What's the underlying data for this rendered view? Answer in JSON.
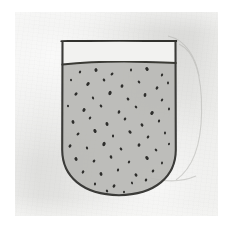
{
  "scene": {
    "title": "Hand-drawn vessel filled with particles",
    "medium": "pencil sketch on paper",
    "canvas": {
      "width": 237,
      "height": 237,
      "background": "#ffffff"
    }
  },
  "paper": {
    "label": "paper-sheet",
    "x": 15,
    "y": 12,
    "width": 203,
    "height": 204,
    "color": "#e9e9e7",
    "edge_color": "#ffffff"
  },
  "vessel": {
    "label": "beaker",
    "shape": "u-shaped-container",
    "stroke_color": "#3a3a38",
    "stroke_width": 2.1,
    "left_wall_x": 62,
    "right_wall_x": 176,
    "rim_y": 41,
    "bottom_y": 195,
    "corner_radius": 56,
    "outline_path": "M 62.5 42.0 L 62.2 150.0 C 62.4 176.0 82.0 194.6 119.0 195.2 C 156.0 194.6 175.6 176.0 175.8 150.0 L 175.5 41.6"
  },
  "rim": {
    "label": "vessel-rim-line",
    "path": "M 61.6 41.4 C 90.0 40.3 140.0 40.4 176.0 41.0",
    "stroke_color": "#33332f",
    "stroke_width": 2.4
  },
  "fill_line": {
    "label": "liquid-surface-line",
    "y": 63,
    "path": "M 62.4 64.6 C 86.0 62.0 118.0 61.2 146.0 61.9 C 160.0 62.2 170.0 62.6 175.8 63.0",
    "stroke_color": "#3a3a36",
    "stroke_width": 2.0
  },
  "fill_region": {
    "label": "granular-contents",
    "color": "#b9b9b5",
    "opacity": 0.92,
    "path": "M 62.4 64.4 C 86.0 61.9 118.0 61.1 146.0 61.8 C 160.0 62.1 170.0 62.5 175.7 62.9 L 175.8 150.0 C 175.6 176.0 156.0 194.2 119.0 194.8 C 82.0 194.2 62.4 176.0 62.2 150.0 Z"
  },
  "headspace": {
    "label": "empty-headspace",
    "color": "#f2f2f0",
    "top_y": 41,
    "bottom_y": 63
  },
  "ghost_outline": {
    "label": "erased-construction-line",
    "stroke_color": "#b4b4b0",
    "stroke_width": 1.1,
    "opacity": 0.55,
    "paths": [
      "M 179.0 44.0 C 196.0 52.0 202.0 78.0 201.6 112.0 C 201.2 146.0 193.0 168.0 176.0 180.0",
      "M 168.0 36.0 C 186.0 40.0 196.0 58.0 199.0 76.0",
      "M 150.0 178.0 C 166.0 182.0 182.0 182.0 196.0 176.0"
    ]
  },
  "particles": {
    "label": "suspended-particles",
    "count": 62,
    "color": "#2e2e2c",
    "typical_size_px": [
      2,
      3
    ],
    "points": [
      {
        "x": 80,
        "y": 72,
        "rx": 1.1,
        "ry": 1.5,
        "rot": 25
      },
      {
        "x": 96,
        "y": 70,
        "rx": 1.5,
        "ry": 1.9,
        "rot": -15
      },
      {
        "x": 112,
        "y": 74,
        "rx": 1.2,
        "ry": 1.7,
        "rot": 40
      },
      {
        "x": 131,
        "y": 70,
        "rx": 1.0,
        "ry": 1.4,
        "rot": 10
      },
      {
        "x": 147,
        "y": 69,
        "rx": 1.6,
        "ry": 2.0,
        "rot": -30
      },
      {
        "x": 162,
        "y": 75,
        "rx": 1.1,
        "ry": 1.5,
        "rot": 18
      },
      {
        "x": 71,
        "y": 80,
        "rx": 1.0,
        "ry": 1.3,
        "rot": -5
      },
      {
        "x": 88,
        "y": 84,
        "rx": 1.5,
        "ry": 2.1,
        "rot": 35
      },
      {
        "x": 104,
        "y": 80,
        "rx": 1.2,
        "ry": 1.6,
        "rot": -22
      },
      {
        "x": 122,
        "y": 86,
        "rx": 1.4,
        "ry": 1.8,
        "rot": 12
      },
      {
        "x": 139,
        "y": 82,
        "rx": 1.1,
        "ry": 1.5,
        "rot": -40
      },
      {
        "x": 157,
        "y": 88,
        "rx": 1.3,
        "ry": 1.7,
        "rot": 28
      },
      {
        "x": 168,
        "y": 83,
        "rx": 1.0,
        "ry": 1.4,
        "rot": 0
      },
      {
        "x": 76,
        "y": 94,
        "rx": 1.3,
        "ry": 1.8,
        "rot": 45
      },
      {
        "x": 93,
        "y": 98,
        "rx": 1.1,
        "ry": 1.5,
        "rot": -18
      },
      {
        "x": 110,
        "y": 93,
        "rx": 1.6,
        "ry": 2.2,
        "rot": 20
      },
      {
        "x": 128,
        "y": 99,
        "rx": 1.2,
        "ry": 1.6,
        "rot": -35
      },
      {
        "x": 145,
        "y": 95,
        "rx": 1.4,
        "ry": 1.9,
        "rot": 8
      },
      {
        "x": 162,
        "y": 100,
        "rx": 1.1,
        "ry": 1.5,
        "rot": 33
      },
      {
        "x": 68,
        "y": 106,
        "rx": 1.0,
        "ry": 1.3,
        "rot": -10
      },
      {
        "x": 84,
        "y": 110,
        "rx": 1.5,
        "ry": 2.0,
        "rot": 24
      },
      {
        "x": 101,
        "y": 106,
        "rx": 1.2,
        "ry": 1.6,
        "rot": -28
      },
      {
        "x": 119,
        "y": 112,
        "rx": 1.3,
        "ry": 1.8,
        "rot": 15
      },
      {
        "x": 136,
        "y": 107,
        "rx": 1.1,
        "ry": 1.5,
        "rot": -42
      },
      {
        "x": 152,
        "y": 113,
        "rx": 1.6,
        "ry": 2.1,
        "rot": 30
      },
      {
        "x": 169,
        "y": 109,
        "rx": 1.0,
        "ry": 1.4,
        "rot": 5
      },
      {
        "x": 73,
        "y": 122,
        "rx": 1.4,
        "ry": 1.9,
        "rot": -20
      },
      {
        "x": 90,
        "y": 118,
        "rx": 1.1,
        "ry": 1.5,
        "rot": 38
      },
      {
        "x": 107,
        "y": 124,
        "rx": 1.5,
        "ry": 2.0,
        "rot": -12
      },
      {
        "x": 125,
        "y": 119,
        "rx": 1.2,
        "ry": 1.6,
        "rot": 22
      },
      {
        "x": 142,
        "y": 125,
        "rx": 1.3,
        "ry": 1.7,
        "rot": -33
      },
      {
        "x": 159,
        "y": 121,
        "rx": 1.1,
        "ry": 1.5,
        "rot": 14
      },
      {
        "x": 78,
        "y": 134,
        "rx": 1.2,
        "ry": 1.7,
        "rot": 42
      },
      {
        "x": 95,
        "y": 131,
        "rx": 1.5,
        "ry": 2.1,
        "rot": -25
      },
      {
        "x": 113,
        "y": 136,
        "rx": 1.1,
        "ry": 1.4,
        "rot": 9
      },
      {
        "x": 130,
        "y": 132,
        "rx": 1.4,
        "ry": 1.9,
        "rot": -38
      },
      {
        "x": 148,
        "y": 137,
        "rx": 1.2,
        "ry": 1.6,
        "rot": 26
      },
      {
        "x": 165,
        "y": 133,
        "rx": 1.0,
        "ry": 1.4,
        "rot": -8
      },
      {
        "x": 70,
        "y": 146,
        "rx": 1.3,
        "ry": 1.8,
        "rot": 32
      },
      {
        "x": 87,
        "y": 148,
        "rx": 1.1,
        "ry": 1.5,
        "rot": -16
      },
      {
        "x": 104,
        "y": 144,
        "rx": 1.6,
        "ry": 2.2,
        "rot": 20
      },
      {
        "x": 121,
        "y": 149,
        "rx": 1.2,
        "ry": 1.6,
        "rot": -30
      },
      {
        "x": 139,
        "y": 145,
        "rx": 1.4,
        "ry": 1.8,
        "rot": 11
      },
      {
        "x": 156,
        "y": 150,
        "rx": 1.1,
        "ry": 1.5,
        "rot": -44
      },
      {
        "x": 169,
        "y": 144,
        "rx": 1.0,
        "ry": 1.3,
        "rot": 17
      },
      {
        "x": 76,
        "y": 159,
        "rx": 1.5,
        "ry": 2.0,
        "rot": -22
      },
      {
        "x": 94,
        "y": 161,
        "rx": 1.2,
        "ry": 1.6,
        "rot": 36
      },
      {
        "x": 111,
        "y": 157,
        "rx": 1.3,
        "ry": 1.8,
        "rot": -14
      },
      {
        "x": 129,
        "y": 162,
        "rx": 1.1,
        "ry": 1.5,
        "rot": 27
      },
      {
        "x": 147,
        "y": 158,
        "rx": 1.5,
        "ry": 2.1,
        "rot": -36
      },
      {
        "x": 162,
        "y": 163,
        "rx": 1.0,
        "ry": 1.4,
        "rot": 6
      },
      {
        "x": 83,
        "y": 172,
        "rx": 1.2,
        "ry": 1.7,
        "rot": 29
      },
      {
        "x": 101,
        "y": 174,
        "rx": 1.4,
        "ry": 1.9,
        "rot": -19
      },
      {
        "x": 118,
        "y": 170,
        "rx": 1.1,
        "ry": 1.5,
        "rot": 13
      },
      {
        "x": 136,
        "y": 175,
        "rx": 1.3,
        "ry": 1.8,
        "rot": -31
      },
      {
        "x": 153,
        "y": 171,
        "rx": 1.2,
        "ry": 1.6,
        "rot": 23
      },
      {
        "x": 95,
        "y": 184,
        "rx": 1.1,
        "ry": 1.4,
        "rot": -7
      },
      {
        "x": 114,
        "y": 186,
        "rx": 1.3,
        "ry": 1.7,
        "rot": 34
      },
      {
        "x": 132,
        "y": 183,
        "rx": 1.0,
        "ry": 1.4,
        "rot": -21
      },
      {
        "x": 146,
        "y": 180,
        "rx": 1.2,
        "ry": 1.6,
        "rot": 16
      },
      {
        "x": 107,
        "y": 191,
        "rx": 1.1,
        "ry": 1.5,
        "rot": -26
      },
      {
        "x": 124,
        "y": 192,
        "rx": 1.0,
        "ry": 1.3,
        "rot": 8
      }
    ]
  }
}
